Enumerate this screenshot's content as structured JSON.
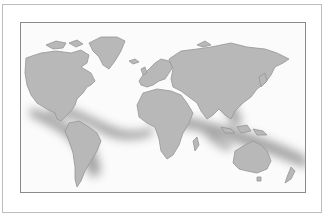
{
  "figure": {
    "type": "world-map",
    "colors": {
      "land": "#b9b9b9",
      "land_edge": "#8f8f8f",
      "shadow_band": "#7a7a7a",
      "ocean": "#fbfbfb",
      "frame": "#8a8a8a"
    },
    "regions": [
      "North America",
      "Greenland",
      "South America",
      "Europe",
      "Africa",
      "Asia",
      "Australia",
      "New Zealand"
    ]
  }
}
